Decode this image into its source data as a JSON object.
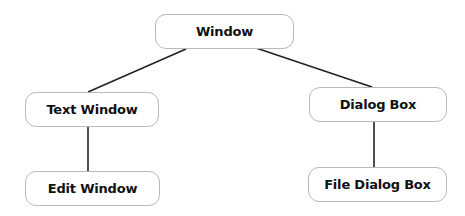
{
  "diagram": {
    "type": "tree",
    "colors": {
      "node_border": "#b9b9b9",
      "node_fill": "#ffffff",
      "text": "#111111",
      "edge": "#222222",
      "background": "#ffffff"
    },
    "nodes": {
      "window": {
        "label": "Window",
        "x": 155,
        "y": 14,
        "w": 139,
        "h": 35
      },
      "text_window": {
        "label": "Text Window",
        "x": 25,
        "y": 92,
        "w": 134,
        "h": 35
      },
      "dialog_box": {
        "label": "Dialog Box",
        "x": 309,
        "y": 87,
        "w": 138,
        "h": 35
      },
      "edit_window": {
        "label": "Edit Window",
        "x": 25,
        "y": 171,
        "w": 135,
        "h": 35
      },
      "file_dialog_box": {
        "label": "File Dialog Box",
        "x": 308,
        "y": 167,
        "w": 139,
        "h": 35
      }
    },
    "edges": [
      {
        "from": "Window",
        "to": "Text Window"
      },
      {
        "from": "Window",
        "to": "Dialog Box"
      },
      {
        "from": "Text Window",
        "to": "Edit Window"
      },
      {
        "from": "Dialog Box",
        "to": "File Dialog Box"
      }
    ]
  }
}
